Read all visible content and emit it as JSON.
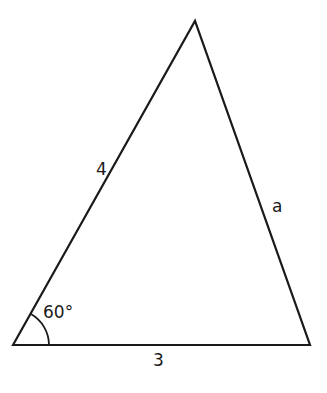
{
  "diagram": {
    "type": "triangle",
    "vertices": {
      "bottom_left": [
        13,
        345
      ],
      "apex": [
        195,
        21
      ],
      "bottom_right": [
        310,
        345
      ]
    },
    "labels": {
      "left_side": "4",
      "right_side": "a",
      "base": "3",
      "angle": "60°"
    },
    "angle_arc": {
      "vertex": "bottom_left",
      "radius": 36
    },
    "colors": {
      "stroke": "#1a1a1a",
      "background": "#ffffff"
    }
  }
}
